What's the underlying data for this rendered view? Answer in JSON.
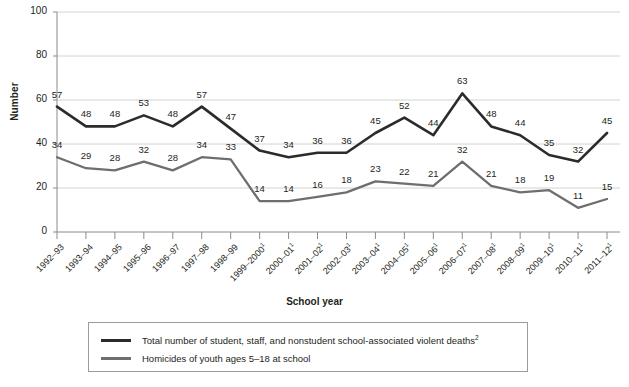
{
  "chart_data": {
    "type": "line",
    "title": "",
    "xlabel": "School year",
    "ylabel": "Number",
    "ylim": [
      0,
      100
    ],
    "ytick_values": [
      0,
      20,
      40,
      60,
      80,
      100
    ],
    "grid": "horizontal",
    "legend_position": "bottom",
    "categories": [
      "1992–93",
      "1993–94",
      "1994–95",
      "1995–96",
      "1996–97",
      "1997–98",
      "1998–99",
      "1999–2000",
      "2000–01",
      "2001–02",
      "2002–03",
      "2003–04",
      "2004–05",
      "2005–06",
      "2006–07",
      "2007–08",
      "2008–09",
      "2009–10",
      "2010–11",
      "2011–12"
    ],
    "category_footnotes": [
      "",
      "",
      "",
      "",
      "",
      "",
      "",
      "1",
      "1",
      "1",
      "1",
      "1",
      "1",
      "1",
      "1",
      "1",
      "1",
      "1",
      "1",
      "1"
    ],
    "series": [
      {
        "name": "Total number of student, staff, and nonstudent school-associated violent deaths",
        "footnote": "2",
        "color": "#2b2b2b",
        "values": [
          57,
          48,
          48,
          53,
          48,
          57,
          47,
          37,
          34,
          36,
          36,
          45,
          52,
          44,
          63,
          48,
          44,
          35,
          32,
          45
        ]
      },
      {
        "name": "Homicides of youth ages 5–18 at school",
        "footnote": "",
        "color": "#6e6e6e",
        "values": [
          34,
          29,
          28,
          32,
          28,
          34,
          33,
          14,
          14,
          16,
          18,
          23,
          22,
          21,
          32,
          21,
          18,
          19,
          11,
          15
        ]
      }
    ]
  }
}
